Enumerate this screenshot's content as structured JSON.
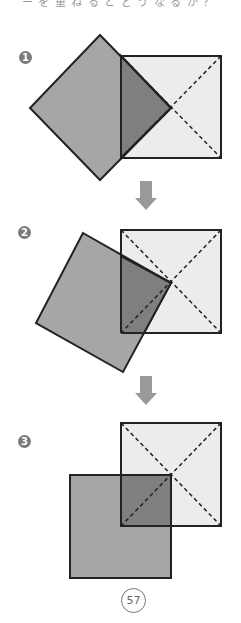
{
  "header": {
    "clipped_text": "ー を 重 ね る と ど う な る か ？"
  },
  "steps": [
    {
      "badge": "1"
    },
    {
      "badge": "2"
    },
    {
      "badge": "3"
    }
  ],
  "colors": {
    "fixed_square_fill": "#ececec",
    "moving_square_fill": "#a6a6a6",
    "overlap_fill": "#7f7f7f",
    "outline": "#222222",
    "arrow": "#999999",
    "badge": "#7a7a7a"
  },
  "page_number": "57"
}
